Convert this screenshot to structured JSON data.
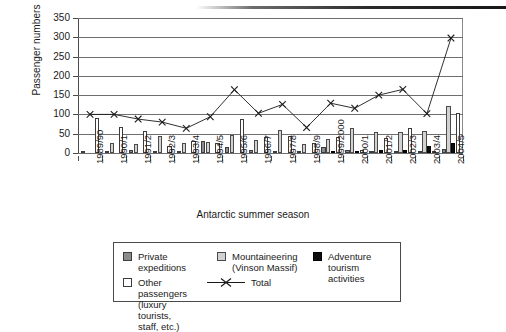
{
  "chart_data": {
    "type": "bar",
    "title": "",
    "xlabel": "Antarctic summer season",
    "ylabel": "Passenger numbers",
    "ylim": [
      0,
      350
    ],
    "yticks": [
      0,
      50,
      100,
      150,
      200,
      250,
      300,
      350
    ],
    "grid": true,
    "legend_position": "bottom",
    "categories": [
      "1989/90",
      "1990/1",
      "1991/2",
      "1992/3",
      "1993/4",
      "1994/5",
      "1995/6",
      "1996/7",
      "1997/8",
      "1998/9",
      "1999/2000",
      "2000/1",
      "2001/2",
      "2002/3",
      "2003/4",
      "2004/5"
    ],
    "series": [
      {
        "name": "Private expeditions",
        "type": "bar",
        "color": "#8c8c8c",
        "values": [
          5,
          3,
          8,
          6,
          2,
          30,
          15,
          9,
          2,
          3,
          16,
          9,
          3,
          5,
          1,
          10
        ]
      },
      {
        "name": "Mountaineering (Vinson Massif)",
        "type": "bar",
        "color": "#d2d2d2",
        "values": [
          0,
          26,
          24,
          45,
          26,
          29,
          46,
          35,
          60,
          23,
          37,
          65,
          54,
          55,
          57,
          121
        ]
      },
      {
        "name": "Adventure tourism activities",
        "type": "bar",
        "color": "#0d0d0d",
        "values": [
          0,
          0,
          0,
          0,
          0,
          0,
          0,
          0,
          0,
          0,
          5,
          3,
          7,
          7,
          19,
          27
        ]
      },
      {
        "name": "Other passengers (luxury tourists, staff, etc.)",
        "type": "bar",
        "color": "#ffffff",
        "values": [
          90,
          67,
          58,
          19,
          32,
          27,
          88,
          42,
          44,
          25,
          42,
          9,
          40,
          64,
          4,
          105
        ]
      },
      {
        "name": "Total",
        "type": "line",
        "marker": "x",
        "color": "#1a1a1a",
        "values": [
          100,
          100,
          88,
          80,
          64,
          94,
          164,
          103,
          126,
          66,
          129,
          116,
          150,
          165,
          102,
          298
        ]
      }
    ]
  },
  "axis": {
    "ylabel": "Passenger numbers",
    "xlabel": "Antarctic summer season",
    "ytick_labels": [
      "350",
      "300",
      "250",
      "200",
      "150",
      "100",
      "50",
      "0"
    ]
  },
  "legend": {
    "items": [
      {
        "key": "private",
        "label": "Private\nexpeditions",
        "swatch": "dark-gray-square"
      },
      {
        "key": "mountaineering",
        "label": "Mountaineering\n(Vinson Massif)",
        "swatch": "light-gray-square"
      },
      {
        "key": "adventure",
        "label": "Adventure tourism\nactivities",
        "swatch": "black-square"
      },
      {
        "key": "other",
        "label": "Other passengers (luxury\ntourists, staff, etc.)",
        "swatch": "white-square"
      },
      {
        "key": "total",
        "label": "Total",
        "swatch": "x-marker-line"
      }
    ]
  }
}
